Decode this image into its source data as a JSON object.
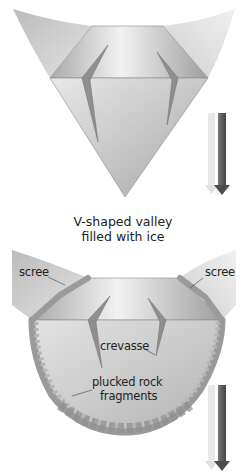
{
  "diagram": {
    "top_panel": {
      "name": "V-shaped valley filled with ice",
      "caption_line1": "V-shaped valley",
      "caption_line2": "filled with ice"
    },
    "bottom_panel": {
      "name": "U-shaped valley with glacier",
      "labels": {
        "scree_left": "scree",
        "scree_right": "scree",
        "crevasse": "crevasse",
        "plucked_line1": "plucked rock",
        "plucked_line2": "fragments"
      }
    },
    "arrows": [
      {
        "panel": "top",
        "direction": "down",
        "icon": "down-arrow-icon"
      },
      {
        "panel": "bottom",
        "direction": "down",
        "icon": "down-arrow-icon"
      }
    ],
    "colors": {
      "valley_wall": "#c9c9c9",
      "ice_top": "#bdbdbd",
      "ice_face": "#b5b5b5",
      "crevasse": "#8f8f8f",
      "rock": "#9a9a9a",
      "arrow_dark": "#5a5a5a",
      "arrow_light": "#e6e6e6",
      "text": "#222222"
    }
  }
}
